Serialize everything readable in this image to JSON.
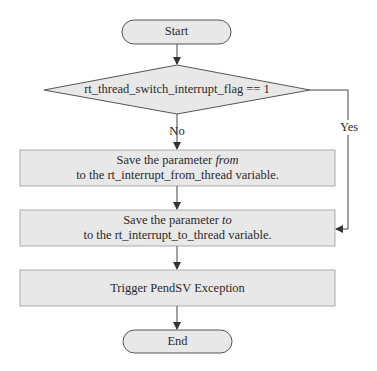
{
  "flowchart": {
    "start": {
      "label": "Start"
    },
    "decision": {
      "label": "rt_thread_switch_interrupt_flag == 1"
    },
    "branches": {
      "no": "No",
      "yes": "Yes"
    },
    "step1": {
      "line1_prefix": "Save the parameter ",
      "line1_em": "from",
      "line2": "to the rt_interrupt_from_thread variable."
    },
    "step2": {
      "line1_prefix": "Save the parameter ",
      "line1_em": "to",
      "line2": "to the rt_interrupt_to_thread variable."
    },
    "step3": {
      "label": "Trigger PendSV Exception"
    },
    "end": {
      "label": "End"
    },
    "colors": {
      "fill": "#e8e8e8",
      "stroke": "#555555",
      "text": "#2a2a2a"
    }
  }
}
